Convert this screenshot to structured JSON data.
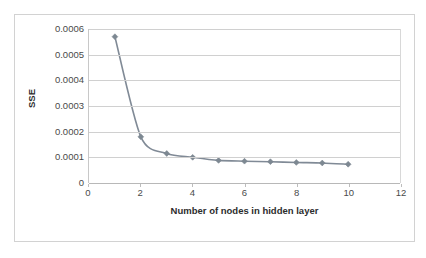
{
  "chart_data": {
    "type": "line",
    "title": "",
    "xlabel": "Number of nodes in hidden layer",
    "ylabel": "SSE",
    "x": [
      1,
      2,
      3,
      4,
      5,
      6,
      7,
      8,
      9,
      10
    ],
    "values": [
      0.00057,
      0.00018,
      0.000115,
      0.0001,
      8.8e-05,
      8.5e-05,
      8.3e-05,
      8e-05,
      7.8e-05,
      7.3e-05
    ],
    "series": [
      {
        "name": "SSE",
        "values": [
          0.00057,
          0.00018,
          0.000115,
          0.0001,
          8.8e-05,
          8.5e-05,
          8.3e-05,
          8e-05,
          7.8e-05,
          7.3e-05
        ]
      }
    ],
    "xlim": [
      0,
      12
    ],
    "ylim": [
      0,
      0.0006
    ],
    "xticks": [
      0,
      2,
      4,
      6,
      8,
      10,
      12
    ],
    "xtick_labels": [
      "0",
      "2",
      "4",
      "6",
      "8",
      "10",
      "12"
    ],
    "yticks": [
      0,
      0.0001,
      0.0002,
      0.0003,
      0.0004,
      0.0005,
      0.0006
    ],
    "ytick_labels": [
      "0",
      "0.0001",
      "0.0002",
      "0.0003",
      "0.0004",
      "0.0005",
      "0.0006"
    ],
    "grid": "horizontal",
    "legend": "none",
    "marker": "diamond",
    "line_color": "#808a96",
    "marker_color": "#7d8892",
    "gridline_color": "#d0d0d0",
    "border_color": "#d2d2d2",
    "background_color": "#ffffff",
    "annotations": []
  }
}
